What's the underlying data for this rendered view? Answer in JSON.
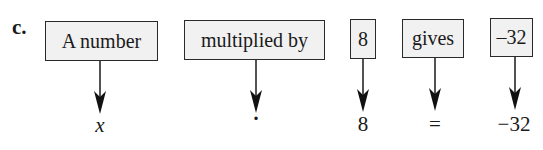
{
  "part_label": "c.",
  "phrases": [
    {
      "text": "A number",
      "symbol": "x",
      "italic": true
    },
    {
      "text": "multiplied by",
      "symbol": "·",
      "italic": false
    },
    {
      "text": "8",
      "symbol": "8",
      "italic": false
    },
    {
      "text": "gives",
      "symbol": "=",
      "italic": false
    },
    {
      "text": "–32",
      "symbol": "−32",
      "italic": false
    }
  ],
  "colors": {
    "box_fill": "#f1f1f1",
    "stroke": "#1a1a1a"
  }
}
